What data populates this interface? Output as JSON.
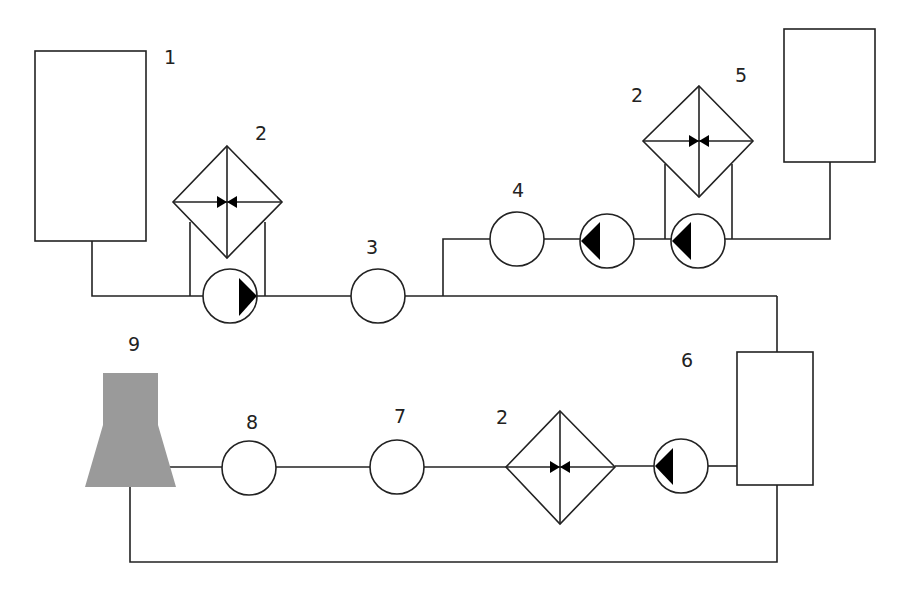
{
  "diagram": {
    "type": "process-flow-schematic",
    "colors": {
      "line": "#222222",
      "background": "#ffffff",
      "cooling_tower_fill": "#9a9a9a",
      "pump_arrow": "#000000"
    },
    "labels": {
      "tank_1": "1",
      "valve_left": "2",
      "circle_3": "3",
      "circle_4": "4",
      "valve_right": "2",
      "tank_5": "5",
      "tank_6": "6",
      "valve_bottom": "2",
      "circle_7": "7",
      "circle_8": "8",
      "cooling_tower_9": "9"
    },
    "components": [
      {
        "id": "1",
        "kind": "tank",
        "name": "Tank 1"
      },
      {
        "id": "2",
        "kind": "filter-with-valve",
        "count": 3
      },
      {
        "id": "3",
        "kind": "circle-component"
      },
      {
        "id": "4",
        "kind": "circle-component"
      },
      {
        "id": "5",
        "kind": "tank",
        "name": "Tank 5"
      },
      {
        "id": "6",
        "kind": "tank",
        "name": "Tank 6"
      },
      {
        "id": "7",
        "kind": "circle-component"
      },
      {
        "id": "8",
        "kind": "circle-component"
      },
      {
        "id": "9",
        "kind": "cooling-tower"
      },
      {
        "id": "pump",
        "kind": "pump",
        "count": 4
      }
    ]
  }
}
